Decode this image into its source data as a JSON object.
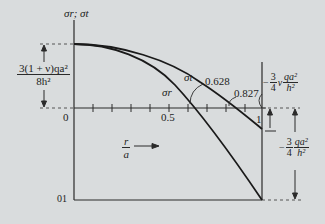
{
  "diagram": {
    "y_axis_label": "σr; σt",
    "x_axis_label_num": "r",
    "x_axis_label_den": "a",
    "origin_label": "0",
    "bottom_origin_label": "01",
    "ticks": {
      "half": "0.5",
      "one": "1"
    },
    "max_stress_num": "3(1 + ν)qa²",
    "max_stress_den": "8h²",
    "sigma_t_label": "σt",
    "sigma_r_label": "σr",
    "sigma_r_zero": "0.628",
    "sigma_t_zero": "0.827",
    "edge_t_prefix": "−",
    "edge_t_coef_num": "3",
    "edge_t_coef_den": "4",
    "edge_t_nu": "ν",
    "edge_t_num": "qa²",
    "edge_t_den": "h²",
    "edge_r_prefix": "−",
    "edge_r_coef_num": "3",
    "edge_r_coef_den": "4",
    "edge_r_num": "qa²",
    "edge_r_den": "h²"
  },
  "colors": {
    "background": "#d9dcdd",
    "ink": "#1c1c1c"
  }
}
